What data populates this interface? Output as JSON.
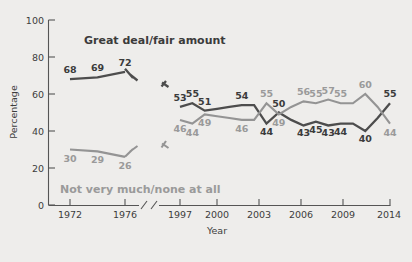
{
  "chart_data": {
    "type": "line",
    "title": "",
    "xlabel": "Year",
    "ylabel": "Percentage",
    "ylim": [
      0,
      100
    ],
    "yticks": [
      0,
      20,
      40,
      60,
      80,
      100
    ],
    "xticks": [
      "1972",
      "1976",
      "1997",
      "2000",
      "2003",
      "2006",
      "2009",
      "2014"
    ],
    "axis_break": true,
    "axis_break_between": [
      "1976",
      "1997"
    ],
    "grid": false,
    "legend_position": "inline-annotation",
    "series": [
      {
        "name": "Great deal/fair amount",
        "color": "#4d4d4d",
        "segments": [
          {
            "x": [
              1972,
              1974,
              1976
            ],
            "values": [
              68,
              69,
              72
            ],
            "labels": [
              "68",
              "69",
              "72"
            ]
          },
          {
            "x": [
              1997,
              1998,
              1999,
              2000,
              2001,
              2002,
              2003,
              2004,
              2005,
              2006,
              2007,
              2008,
              2009,
              2010,
              2011,
              2012,
              2013,
              2014
            ],
            "values": [
              53,
              55,
              51,
              52,
              53,
              54,
              54,
              44,
              50,
              46,
              43,
              45,
              43,
              44,
              44,
              40,
              47,
              55
            ],
            "labels": [
              "53",
              "55",
              "51",
              "",
              "",
              "54",
              "",
              "44",
              "50",
              "",
              "43",
              "45",
              "43",
              "44",
              "",
              "40",
              "",
              "55"
            ]
          }
        ]
      },
      {
        "name": "Not very much/none at all",
        "color": "#949494",
        "segments": [
          {
            "x": [
              1972,
              1974,
              1976
            ],
            "values": [
              30,
              29,
              26
            ],
            "labels": [
              "30",
              "29",
              "26"
            ]
          },
          {
            "x": [
              1997,
              1998,
              1999,
              2000,
              2001,
              2002,
              2003,
              2004,
              2005,
              2006,
              2007,
              2008,
              2009,
              2010,
              2011,
              2012,
              2013,
              2014
            ],
            "values": [
              46,
              44,
              49,
              48,
              47,
              46,
              46,
              55,
              49,
              53,
              56,
              55,
              57,
              55,
              55,
              60,
              53,
              44
            ],
            "labels": [
              "46",
              "44",
              "49",
              "",
              "",
              "46",
              "",
              "55",
              "49",
              "",
              "56",
              "55",
              "57",
              "55",
              "",
              "60",
              "",
              "44"
            ]
          }
        ]
      }
    ]
  },
  "annotations": {
    "series_a_title": "Great deal/fair amount",
    "series_b_title": "Not very much/none at all"
  },
  "axes": {
    "y_label": "Percentage",
    "x_label": "Year",
    "y_tick_labels": [
      "0",
      "20",
      "40",
      "60",
      "80",
      "100"
    ],
    "x_tick_labels": [
      "1972",
      "1976",
      "1997",
      "2000",
      "2003",
      "2006",
      "2009",
      "2014"
    ]
  },
  "colors": {
    "background": "#eeedeb",
    "series_a": "#4d4d4d",
    "series_b": "#949494",
    "axis": "#555555",
    "text": "#3d3d3d"
  }
}
